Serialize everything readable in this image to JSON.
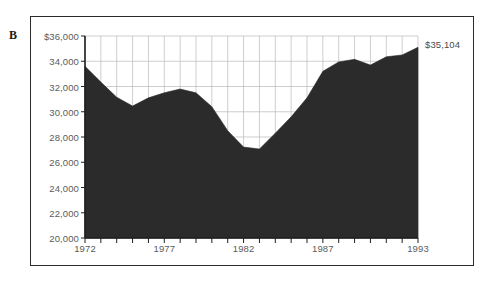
{
  "figure": {
    "panel_label": "B",
    "end_value_annotation": "$35,104"
  },
  "colors": {
    "area_fill": "#2b2b2b",
    "frame": "#2b2b2b",
    "axis": "#1f1f1f",
    "grid": "#b9b9b9",
    "tick_label": "#5b5b5b",
    "background": "#ffffff"
  },
  "chart_data": {
    "type": "area",
    "title": "",
    "subtitle": "",
    "xlabel": "",
    "ylabel": "",
    "xlim": [
      1972,
      1993
    ],
    "ylim": [
      20000,
      36000
    ],
    "grid": true,
    "legend": null,
    "y_tick_labels": [
      "$36,000",
      "34,000",
      "32,000",
      "30,000",
      "28,000",
      "26,000",
      "24,000",
      "22,000",
      "20,000"
    ],
    "y_ticks": [
      36000,
      34000,
      32000,
      30000,
      28000,
      26000,
      24000,
      22000,
      20000
    ],
    "x_tick_labels": [
      "1972",
      "1977",
      "1982",
      "1987",
      "1993"
    ],
    "x_ticks_labeled": [
      1972,
      1977,
      1982,
      1987,
      1993
    ],
    "x_ticks_all": [
      1972,
      1973,
      1974,
      1975,
      1976,
      1977,
      1978,
      1979,
      1980,
      1981,
      1982,
      1983,
      1984,
      1985,
      1986,
      1987,
      1988,
      1989,
      1990,
      1991,
      1992,
      1993
    ],
    "annotations": [
      {
        "text": "$35,104",
        "x": 1993,
        "y": 35104,
        "position": "right-of-axis"
      }
    ],
    "x": [
      1972,
      1973,
      1974,
      1975,
      1976,
      1977,
      1978,
      1979,
      1980,
      1981,
      1982,
      1983,
      1984,
      1985,
      1986,
      1987,
      1988,
      1989,
      1990,
      1991,
      1992,
      1993
    ],
    "values": [
      33600,
      32350,
      31150,
      30450,
      31100,
      31500,
      31800,
      31500,
      30400,
      28500,
      27200,
      27050,
      28300,
      29600,
      31100,
      33200,
      33950,
      34150,
      33700,
      34350,
      34500,
      35104
    ]
  }
}
